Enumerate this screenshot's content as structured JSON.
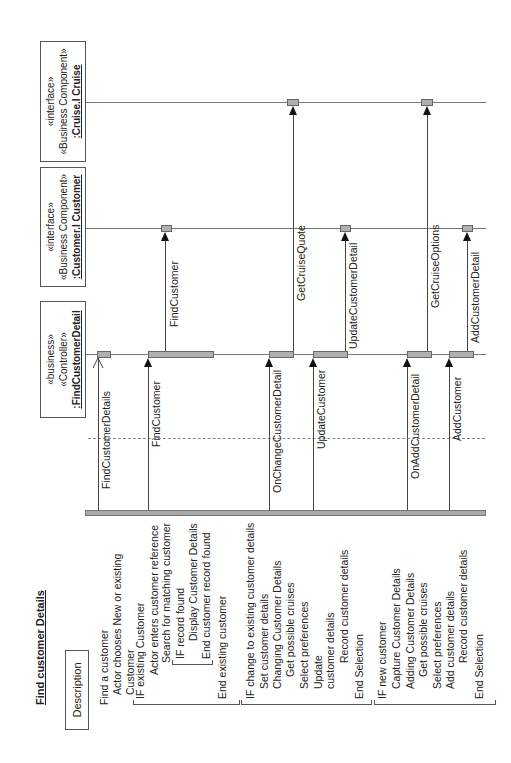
{
  "title": "Find customer Details",
  "description_label": "Description",
  "description": {
    "find": [
      "Find a customer",
      "Actor chooses New or existing",
      "Customer"
    ],
    "existing": [
      "IF existing Customer",
      "Actor enters customer reference",
      "Search for matching customer",
      "IF record found",
      "Display Customer Details",
      "End customer record found",
      "End existing customer"
    ],
    "change": [
      "IF change to existing customer details",
      "Set customer details",
      "Changing Customer Details",
      "Get possible cruises",
      "Select preferences",
      "Update",
      "customer details",
      "Record customer details",
      "End Selection"
    ],
    "new": [
      "IF new customer",
      "Capture Customer Details",
      "Adding Customer Details",
      "Get possible cruises",
      "Select preferences",
      "Add customer details",
      "Record customer details",
      "End Selection"
    ]
  },
  "objects": [
    {
      "stereo1": "«business»",
      "stereo2": "«Controller»",
      "name": ":FindCustomerDetail"
    },
    {
      "stereo1": "«interface»",
      "stereo2": "«Business Component»",
      "name": ":Customer.I Customer"
    },
    {
      "stereo1": "«interface»",
      "stereo2": "«Business Component»",
      "name": ":Cruise.I Cruise"
    }
  ],
  "messages": {
    "m1": "FindCustomerDetails",
    "m2": "FindCustomer",
    "m3": "FindCustomer",
    "m4": "OnChangeCustomerDetail",
    "m5": "GetCruiseQuote",
    "m6": "UpdateCustomer",
    "m7": "UpdateCustomerDetail",
    "m8": "OnAddCustomerDetail",
    "m9": "GetCruiseOptions",
    "m10": "AddCustomer",
    "m11": "AddCustomerDetail"
  },
  "colors": {
    "activation": "#b0b0b0",
    "lifeline": "#777777",
    "text": "#222222"
  }
}
